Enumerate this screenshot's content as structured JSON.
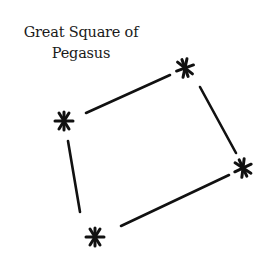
{
  "title": {
    "line1": "Great Square of",
    "line2": "Pegasus"
  },
  "diagram": {
    "type": "constellation",
    "stars": [
      {
        "id": "star-left",
        "x": 64,
        "y": 121
      },
      {
        "id": "star-top",
        "x": 185,
        "y": 68
      },
      {
        "id": "star-right",
        "x": 243,
        "y": 168
      },
      {
        "id": "star-bottom",
        "x": 95,
        "y": 237
      }
    ],
    "lines": [
      {
        "from": "star-left",
        "to": "star-top"
      },
      {
        "from": "star-top",
        "to": "star-right"
      },
      {
        "from": "star-right",
        "to": "star-bottom"
      },
      {
        "from": "star-bottom",
        "to": "star-left"
      }
    ],
    "ink_color": "#111111"
  }
}
